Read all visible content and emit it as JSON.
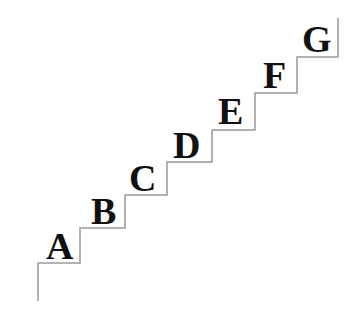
{
  "figure": {
    "kind": "staircase-diagram",
    "background_color": "#ffffff",
    "line_color": "#999999",
    "line_width": 1.5,
    "label_color": "#111111",
    "label_font_size": 38,
    "width": 356,
    "height": 318
  },
  "staircase": {
    "path": "M 38 301 L 38 263 L 80 263 L 80 228 L 125 228 L 125 195 L 167 195 L 167 162 L 212 162 L 212 130 L 255 130 L 255 93 L 297 93 L 297 57 L 338 57 L 338 18",
    "step_count": 7,
    "direction": "ascending-left-to-right"
  },
  "steps": [
    {
      "label": "A",
      "x": 46,
      "y": 227,
      "size": 38
    },
    {
      "label": "B",
      "x": 91,
      "y": 192,
      "size": 38
    },
    {
      "label": "C",
      "x": 129,
      "y": 159,
      "size": 38
    },
    {
      "label": "D",
      "x": 173,
      "y": 126,
      "size": 38
    },
    {
      "label": "E",
      "x": 218,
      "y": 92,
      "size": 38
    },
    {
      "label": "F",
      "x": 263,
      "y": 56,
      "size": 38
    },
    {
      "label": "G",
      "x": 302,
      "y": 20,
      "size": 38
    }
  ]
}
